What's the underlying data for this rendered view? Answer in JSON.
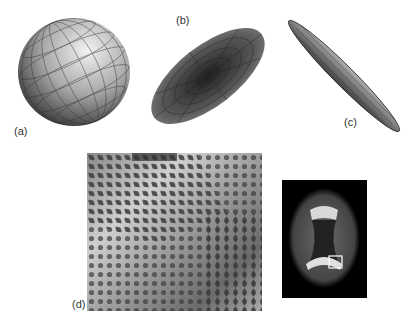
{
  "figure": {
    "panels": [
      {
        "id": "a",
        "label": "(a)",
        "description": "sphere (isotropic tensor glyph)"
      },
      {
        "id": "b",
        "label": "(b)",
        "description": "oblate / planar ellipsoid"
      },
      {
        "id": "c",
        "label": "(c)",
        "description": "prolate / linear ellipsoid"
      },
      {
        "id": "d",
        "label": "(d)",
        "description": "tensor glyph field over grayscale map"
      }
    ],
    "inset": {
      "description": "brain axial slice with highlighted ROI box"
    },
    "colors": {
      "background": "#ffffff",
      "glyph_dark": "#3a3a3a",
      "glyph_light": "#d0d0d0",
      "brain_bg": "#000000",
      "roi_box": "#ffffff"
    }
  }
}
